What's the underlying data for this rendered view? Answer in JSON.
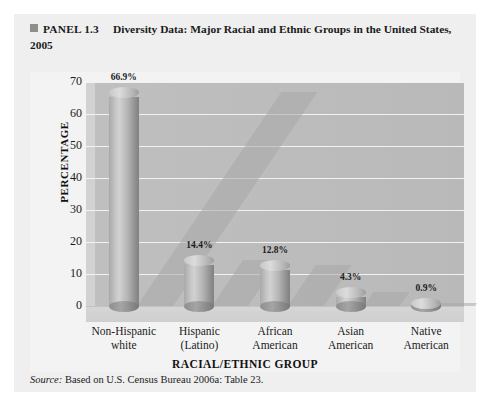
{
  "caption": {
    "marker": "square-bullet",
    "panel_label": "PANEL 1.3",
    "title": "Diversity Data: Major Racial and Ethnic Groups in the United States, 2005"
  },
  "source": {
    "prefix": "Source:",
    "text": " Based on U.S. Census Bureau 2006a: Table 23."
  },
  "chart_data": {
    "type": "bar",
    "title": "Diversity Data: Major Racial and Ethnic Groups in the United States, 2005",
    "xlabel": "RACIAL/ETHNIC GROUP",
    "ylabel": "PERCENTAGE",
    "ylim": [
      0,
      70
    ],
    "yticks": [
      0,
      10,
      20,
      30,
      40,
      50,
      60,
      70
    ],
    "ytick_labels": [
      "0",
      "10",
      "20",
      "30",
      "40",
      "50",
      "60",
      "70"
    ],
    "grid": true,
    "legend": "none",
    "categories": [
      "Non-Hispanic white",
      "Hispanic (Latino)",
      "African American",
      "Asian American",
      "Native American"
    ],
    "category_lines": [
      [
        "Non-Hispanic",
        "white"
      ],
      [
        "Hispanic",
        "(Latino)"
      ],
      [
        "African",
        "American"
      ],
      [
        "Asian",
        "American"
      ],
      [
        "Native",
        "American"
      ]
    ],
    "values": [
      66.9,
      14.4,
      12.8,
      4.3,
      0.9
    ],
    "data_labels": [
      "66.9%",
      "14.4%",
      "12.8%",
      "4.3%",
      "0.9%"
    ],
    "colors": {
      "bar": "#b5b5b5",
      "wall": "#bfbfbf",
      "floor": "#d2d2d2",
      "gridline": "#f2f2f2",
      "text": "#1b1b1b",
      "panel_bg": "#efefef"
    }
  }
}
